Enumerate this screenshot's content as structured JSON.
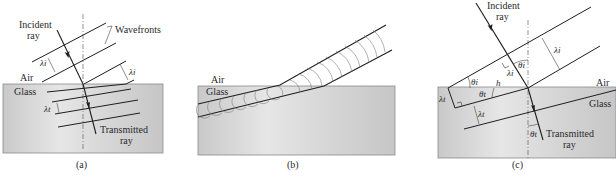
{
  "figure": {
    "panels": [
      {
        "id": "a",
        "caption": "(a)",
        "labels": {
          "incident_line1": "Incident",
          "incident_line2": "ray",
          "wavefronts": "Wavefronts",
          "air": "Air",
          "glass": "Glass",
          "lambda_i_left": "λi",
          "lambda_i_right": "λi",
          "lambda_t": "λt",
          "transmitted_line1": "Transmitted",
          "transmitted_line2": "ray"
        }
      },
      {
        "id": "b",
        "caption": "(b)",
        "labels": {
          "air": "Air",
          "glass": "Glass"
        }
      },
      {
        "id": "c",
        "caption": "(c)",
        "labels": {
          "incident_line1": "Incident",
          "incident_line2": "ray",
          "lambda_i_top": "λi",
          "lambda_i_mid": "λi",
          "theta_i_normal": "θi",
          "theta_i_surface": "θi",
          "theta_t_surface": "θt",
          "h": "h",
          "air": "Air",
          "glass": "Glass",
          "lambda_t_left": "λt",
          "lambda_t_mid": "λt",
          "theta_t_bottom": "θt",
          "transmitted_line1": "Transmitted",
          "transmitted_line2": "ray"
        }
      }
    ],
    "colors": {
      "glass_fill": "#cfcfcf",
      "glass_edge": "#8a8a8a",
      "line": "#1e1e1e",
      "huygens": "#7a7a7a"
    }
  }
}
